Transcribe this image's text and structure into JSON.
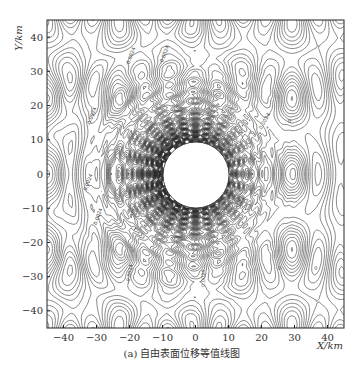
{
  "chart_data": {
    "type": "contour",
    "title": "",
    "caption": "(a) 自由表面位移等值线图",
    "xlabel": "X/km",
    "ylabel": "Y/km",
    "xlim": [
      -45,
      45
    ],
    "ylim": [
      -45,
      45
    ],
    "xticks": [
      -40,
      -30,
      -20,
      -10,
      0,
      10,
      20,
      30,
      40
    ],
    "yticks": [
      -40,
      -30,
      -20,
      -10,
      0,
      10,
      20,
      30,
      40
    ],
    "grid": false,
    "legend": null,
    "contour_labels": [
      "-0.0024",
      "0.0024",
      "0"
    ],
    "obstacle": {
      "shape": "circle",
      "center": [
        0,
        0
      ],
      "radius_km": 10
    }
  },
  "caption": "(a) 自由表面位移等值线图",
  "axes": {
    "xlabel": "X/km",
    "ylabel": "Y/km"
  }
}
